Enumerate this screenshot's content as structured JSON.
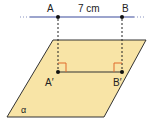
{
  "diagram": {
    "type": "geometry-projection",
    "points": {
      "A": {
        "label": "A",
        "x": 58,
        "y": 17
      },
      "B": {
        "label": "B",
        "x": 122,
        "y": 17
      },
      "A_prime": {
        "label": "A′",
        "x": 58,
        "y": 72
      },
      "B_prime": {
        "label": "B′",
        "x": 122,
        "y": 72
      }
    },
    "segment_label": "7 cm",
    "plane_label": "α",
    "colors": {
      "line_ab": "#3b4b9c",
      "plane_fill": "#f8e4a6",
      "plane_stroke": "#333333",
      "right_angle": "#e06a2a",
      "projection_line": "#222222",
      "point": "#111111"
    }
  }
}
